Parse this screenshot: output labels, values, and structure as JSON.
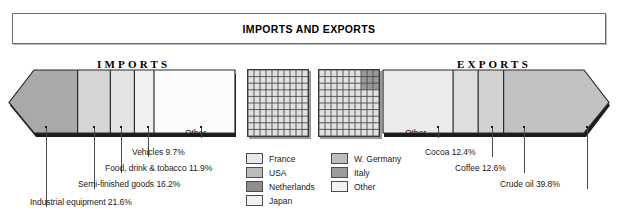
{
  "title": {
    "text": "IMPORTS AND EXPORTS"
  },
  "imports": {
    "heading": "IMPORTS",
    "direction": "left",
    "segments": [
      {
        "label": "Industrial equipment",
        "value": "21.6%",
        "caption": "Industrial equipment 21.6%",
        "pct": 21.6,
        "color": "#a9a9a9"
      },
      {
        "label": "Semi-finished goods",
        "value": "16.2%",
        "caption": "Semi-finished goods 16.2%",
        "pct": 16.2,
        "color": "#d5d5d5"
      },
      {
        "label": "Food, drink & tobacco",
        "value": "11.9%",
        "caption": "Food, drink & tobacco 11.9%",
        "pct": 11.9,
        "color": "#e3e3e3"
      },
      {
        "label": "Vehicles",
        "value": "9.7%",
        "caption": "Vehicles 9.7%",
        "pct": 9.7,
        "color": "#f0f0f0"
      },
      {
        "label": "Other",
        "value": "",
        "caption": "Other",
        "pct": 40.6,
        "color": "#fbfbfb"
      }
    ]
  },
  "exports": {
    "heading": "EXPORTS",
    "direction": "right",
    "segments": [
      {
        "label": "Other",
        "value": "",
        "caption": "Other",
        "pct": 35.2,
        "color": "#ececec"
      },
      {
        "label": "Cocoa",
        "value": "12.4%",
        "caption": "Cocoa 12.4%",
        "pct": 12.4,
        "color": "#dedede"
      },
      {
        "label": "Coffee",
        "value": "12.6%",
        "caption": "Coffee 12.6%",
        "pct": 12.6,
        "color": "#d2d2d2"
      },
      {
        "label": "Crude oil",
        "value": "39.8%",
        "caption": "Crude oil 39.8%",
        "pct": 39.8,
        "color": "#c2c2c2"
      }
    ]
  },
  "grids": {
    "left": {
      "name": "imports-partners-grid",
      "rows": 10,
      "cols": 10,
      "base_color": "#e2e2e2",
      "highlight": null
    },
    "right": {
      "name": "exports-partners-grid",
      "rows": 10,
      "cols": 10,
      "base_color": "#e2e2e2",
      "highlight": {
        "color": "#9a9a9a",
        "row_start": 0,
        "row_end": 3,
        "col_start": 7,
        "col_end": 10
      }
    }
  },
  "legend": {
    "left": [
      {
        "label": "France",
        "color": "#e8e8e8"
      },
      {
        "label": "USA",
        "color": "#bcbcbc"
      },
      {
        "label": "Netherlands",
        "color": "#8e8e8e"
      },
      {
        "label": "Japan",
        "color": "#f2f2f2"
      }
    ],
    "right": [
      {
        "label": "W. Germany",
        "color": "#bdbdbd"
      },
      {
        "label": "Italy",
        "color": "#9c9c9c"
      },
      {
        "label": "Other",
        "color": "#f2f2f2"
      }
    ]
  },
  "chart_data": {
    "type": "bar",
    "title": "IMPORTS AND EXPORTS",
    "xlabel": "",
    "ylabel": "Share of total (%)",
    "note": "Two opposed proportional arrow bars; segment widths are percentage shares of total imports / exports.",
    "series": [
      {
        "name": "Imports",
        "categories": [
          "Industrial equipment",
          "Semi-finished goods",
          "Food, drink & tobacco",
          "Vehicles",
          "Other"
        ],
        "values": [
          21.6,
          16.2,
          11.9,
          9.7,
          40.6
        ]
      },
      {
        "name": "Exports",
        "categories": [
          "Other",
          "Cocoa",
          "Coffee",
          "Crude oil"
        ],
        "values": [
          35.2,
          12.4,
          12.6,
          39.8
        ]
      }
    ],
    "legend_entries": [
      "France",
      "USA",
      "Netherlands",
      "Japan",
      "W. Germany",
      "Italy",
      "Other"
    ],
    "legend_position": "bottom-center"
  }
}
